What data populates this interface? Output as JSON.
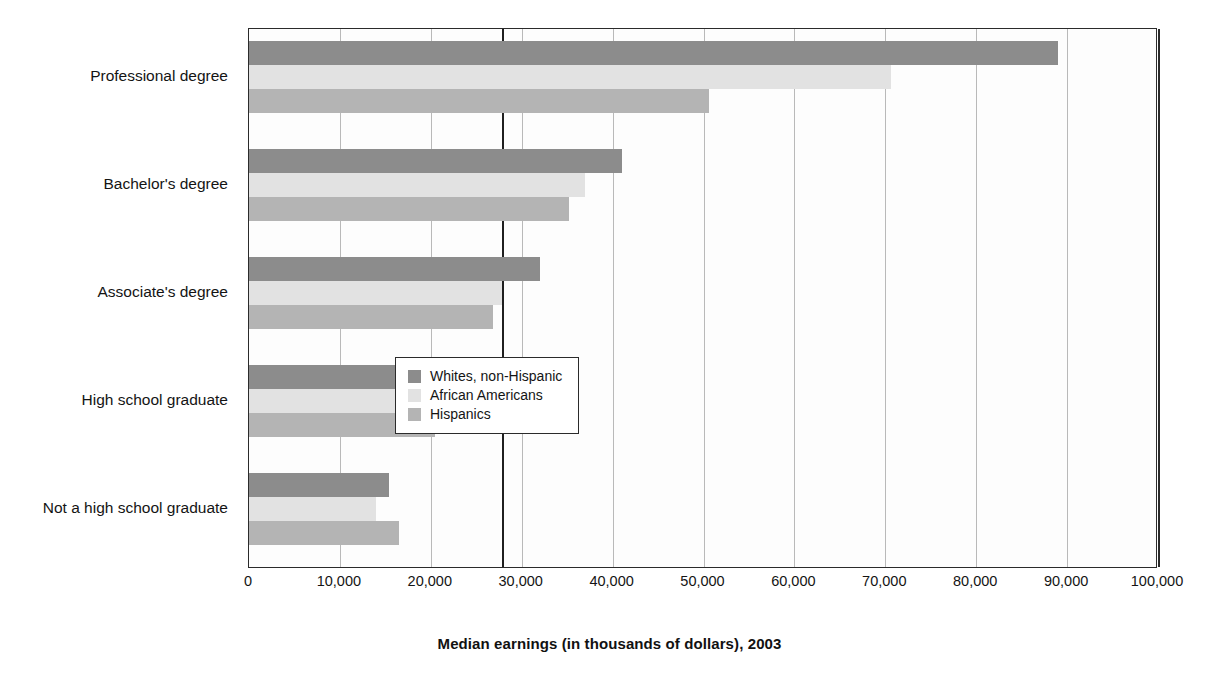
{
  "chart_data": {
    "type": "bar",
    "orientation": "horizontal",
    "title": "",
    "xlabel": "Median earnings (in thousands of dollars), 2003",
    "ylabel": "",
    "xlim": [
      0,
      100000
    ],
    "xticks": [
      0,
      10000,
      20000,
      30000,
      40000,
      50000,
      60000,
      70000,
      80000,
      90000,
      100000
    ],
    "xtick_labels": [
      "0",
      "10,000",
      "20,000",
      "30,000",
      "40,000",
      "50,000",
      "60,000",
      "70,000",
      "80,000",
      "90,000",
      "100,000"
    ],
    "grid": true,
    "legend_position": "center",
    "categories": [
      "Professional degree",
      "Bachelor's degree",
      "Associate's degree",
      "High school graduate",
      "Not a high school graduate"
    ],
    "series": [
      {
        "name": "Whites, non-Hispanic",
        "color": "#8c8c8c",
        "values": [
          89000,
          41000,
          32000,
          25300,
          15400
        ]
      },
      {
        "name": "African Americans",
        "color": "#e2e2e2",
        "values": [
          70600,
          37000,
          27800,
          21100,
          14000
        ]
      },
      {
        "name": "Hispanics",
        "color": "#b4b4b4",
        "values": [
          50600,
          35200,
          26800,
          20500,
          16500
        ]
      }
    ],
    "reference_line": {
      "value": 27800,
      "color": "#1f1f1f"
    }
  },
  "legend": {
    "entries": [
      {
        "label": "Whites, non-Hispanic"
      },
      {
        "label": "African Americans"
      },
      {
        "label": "Hispanics"
      }
    ]
  }
}
